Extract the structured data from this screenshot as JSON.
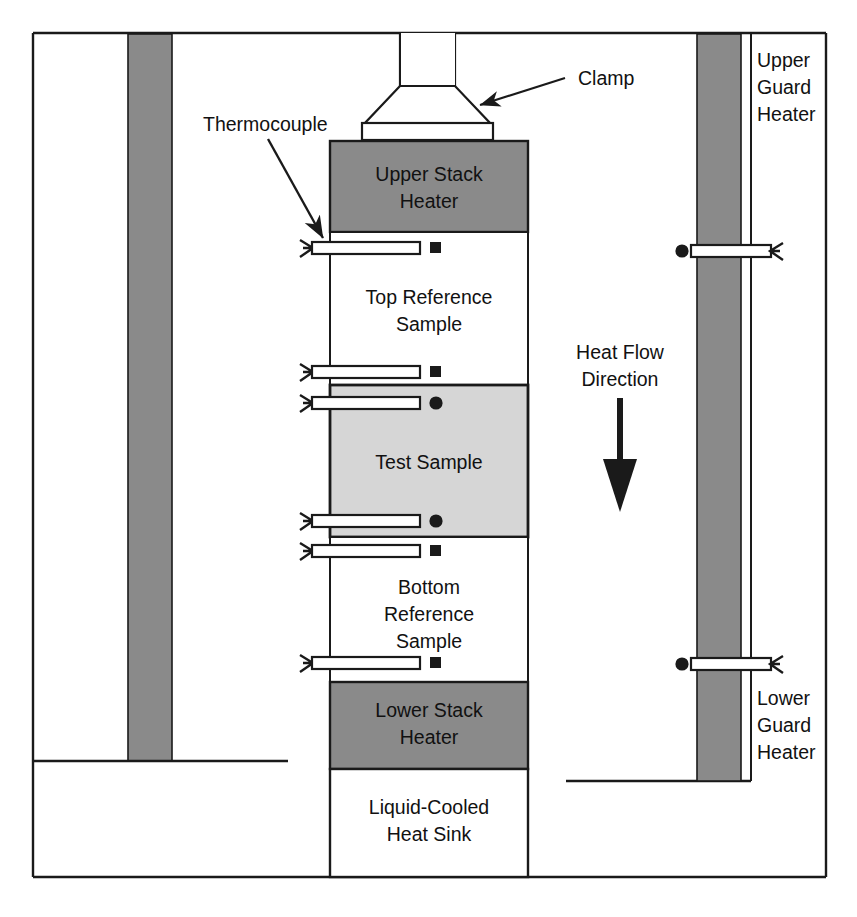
{
  "figure": {
    "kind": "technical-cross-section-diagram",
    "background_color": "#ffffff",
    "line_color": "#1a1a1a",
    "colors": {
      "heater_gray": "#8a8a8a",
      "guard_heater_gray": "#8a8a8a",
      "test_sample_gray": "#d6d6d6",
      "reference_sample_white": "#ffffff",
      "heat_sink_white": "#ffffff",
      "outline": "#1a1a1a"
    }
  },
  "stack": {
    "clamp": {
      "label": "Clamp",
      "callout_label": "Clamp"
    },
    "blocks": [
      {
        "id": "upper-stack-heater",
        "label_lines": [
          "Upper Stack",
          "Heater"
        ],
        "fill": "#8a8a8a"
      },
      {
        "id": "top-reference-sample",
        "label_lines": [
          "Top Reference",
          "Sample"
        ],
        "fill": "#ffffff"
      },
      {
        "id": "test-sample",
        "label_lines": [
          "Test Sample"
        ],
        "fill": "#d6d6d6"
      },
      {
        "id": "bottom-reference-sample",
        "label_lines": [
          "Bottom",
          "Reference",
          "Sample"
        ],
        "fill": "#ffffff"
      },
      {
        "id": "lower-stack-heater",
        "label_lines": [
          "Lower Stack",
          "Heater"
        ],
        "fill": "#8a8a8a"
      },
      {
        "id": "liquid-cooled-heat-sink",
        "label_lines": [
          "Liquid-Cooled",
          "Heat Sink"
        ],
        "fill": "#ffffff"
      }
    ]
  },
  "guard_heaters": {
    "upper": {
      "label_lines": [
        "Upper",
        "Guard",
        "Heater"
      ],
      "fill": "#8a8a8a"
    },
    "lower": {
      "label_lines": [
        "Lower",
        "Guard",
        "Heater"
      ],
      "fill": "#8a8a8a"
    }
  },
  "heat_flow": {
    "label_lines": [
      "Heat Flow",
      "Direction"
    ],
    "direction": "down"
  },
  "thermocouple_callout": {
    "label": "Thermocouple"
  },
  "thermocouples": {
    "stack_probes": [
      {
        "id": "tc-1",
        "y": 248,
        "marker": "square",
        "in_block": "top-reference-sample"
      },
      {
        "id": "tc-2",
        "y": 372,
        "marker": "square",
        "in_block": "top-reference-sample"
      },
      {
        "id": "tc-3",
        "y": 403,
        "marker": "circle",
        "in_block": "test-sample"
      },
      {
        "id": "tc-4",
        "y": 521,
        "marker": "circle",
        "in_block": "test-sample"
      },
      {
        "id": "tc-5",
        "y": 551,
        "marker": "square",
        "in_block": "bottom-reference-sample"
      },
      {
        "id": "tc-6",
        "y": 663,
        "marker": "square",
        "in_block": "bottom-reference-sample"
      }
    ],
    "guard_probes": [
      {
        "id": "tc-guard-upper",
        "y": 251,
        "marker": "circle",
        "in_block": "upper-guard-heater"
      },
      {
        "id": "tc-guard-lower",
        "y": 664,
        "marker": "circle",
        "in_block": "lower-guard-heater"
      }
    ],
    "marker_legend": {
      "square": "reference sample thermocouple",
      "circle": "test sample / guard heater thermocouple"
    }
  }
}
